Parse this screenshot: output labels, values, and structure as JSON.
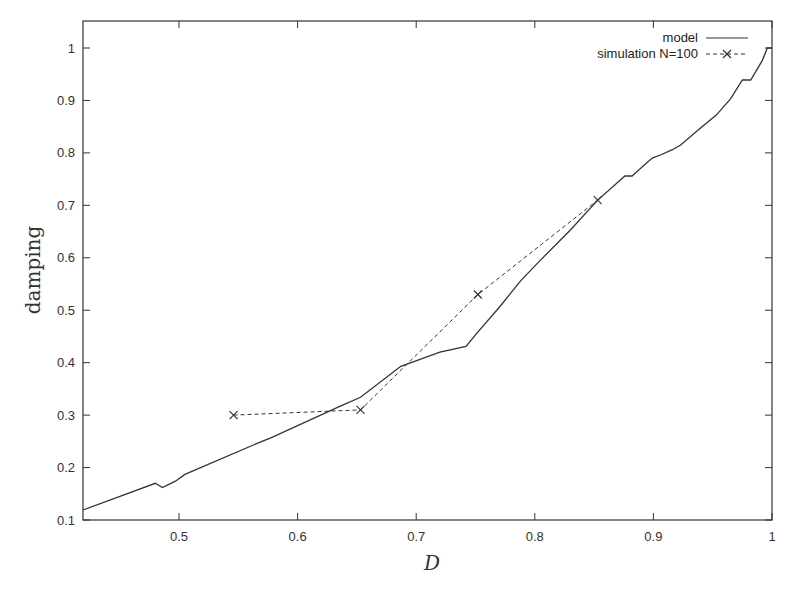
{
  "chart_data": {
    "type": "line",
    "title": "",
    "xlabel": "D",
    "ylabel": "damping",
    "xlim": [
      0.419,
      1.0
    ],
    "ylim": [
      0.1,
      1.05
    ],
    "grid": false,
    "legend_position": "top-right (inside)",
    "x_ticks": [
      "0.5",
      "0.6",
      "0.7",
      "0.8",
      "0.9",
      "1"
    ],
    "x_tick_values": [
      0.5,
      0.6,
      0.7,
      0.8,
      0.9,
      1.0
    ],
    "y_ticks": [
      "0.1",
      "0.2",
      "0.3",
      "0.4",
      "0.5",
      "0.6",
      "0.7",
      "0.8",
      "0.9",
      "1"
    ],
    "y_tick_values": [
      0.1,
      0.2,
      0.3,
      0.4,
      0.5,
      0.6,
      0.7,
      0.8,
      0.9,
      1.0
    ],
    "series": [
      {
        "name": "model",
        "style": "solid",
        "marker": "none",
        "x": [
          0.419,
          0.48,
          0.486,
          0.497,
          0.505,
          0.57,
          0.577,
          0.636,
          0.653,
          0.687,
          0.72,
          0.742,
          0.751,
          0.771,
          0.788,
          0.805,
          0.83,
          0.853,
          0.876,
          0.882,
          0.886,
          0.899,
          0.906,
          0.916,
          0.923,
          0.94,
          0.953,
          0.965,
          0.975,
          0.982,
          0.992,
          0.996,
          1.0
        ],
        "y": [
          0.119,
          0.17,
          0.162,
          0.174,
          0.187,
          0.25,
          0.256,
          0.317,
          0.334,
          0.393,
          0.42,
          0.431,
          0.456,
          0.508,
          0.556,
          0.596,
          0.653,
          0.71,
          0.756,
          0.756,
          0.764,
          0.79,
          0.796,
          0.806,
          0.815,
          0.848,
          0.872,
          0.903,
          0.939,
          0.939,
          0.977,
          1.0,
          1.0
        ]
      },
      {
        "name": "simulation N=100",
        "style": "dashed",
        "marker": "x",
        "x": [
          0.546,
          0.653,
          0.752,
          0.853
        ],
        "y": [
          0.3,
          0.31,
          0.53,
          0.71
        ]
      }
    ]
  },
  "legend": {
    "items": [
      {
        "label": "model",
        "style": "solid"
      },
      {
        "label": "simulation N=100",
        "style": "dashed-x"
      }
    ]
  },
  "colors": {
    "line": "#333333",
    "frame": "#333333",
    "background": "#ffffff"
  }
}
